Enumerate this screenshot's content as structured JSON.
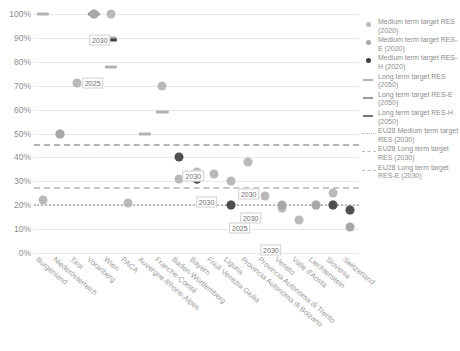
{
  "chart_data": {
    "type": "scatter",
    "title": "",
    "xlabel": "",
    "ylabel": "",
    "ylim": [
      0,
      100
    ],
    "ytick_labels": [
      "100%",
      "90%",
      "80%",
      "70%",
      "60%",
      "50%",
      "40%",
      "30%",
      "20%",
      "10%",
      "0%"
    ],
    "ytick_values": [
      100,
      90,
      80,
      70,
      60,
      50,
      40,
      30,
      20,
      10,
      0
    ],
    "grid": true,
    "legend_position": "right",
    "categories": [
      "Burgenland",
      "Niederösterreich",
      "Tirol",
      "Vorarlberg",
      "Wien",
      "PACA",
      "Auvergne-Rhone-Alpes",
      "Franche-Comté",
      "Baden-Württemberg",
      "Bayern",
      "Friuli Venezia Giulia",
      "Liguria",
      "Provincia Autonoma di Bolzano",
      "Provincia Autonoma di Trento",
      "Veneto",
      "Valle d'Aosta",
      "Liechtenstein",
      "Slovenia",
      "Switzerland"
    ],
    "series": [
      {
        "name": "Medium term target RES (2020)",
        "marker": "circle",
        "color": "#b9b9b9",
        "points": [
          {
            "category": "Vorarlberg",
            "value": 100
          },
          {
            "category": "Wien",
            "value": 100
          },
          {
            "category": "Niederösterreich",
            "value": 50
          },
          {
            "category": "Franche-Comté",
            "value": 70
          },
          {
            "category": "Bayern",
            "value": 34
          },
          {
            "category": "Friuli Venezia Giulia",
            "value": 33
          },
          {
            "category": "Liguria",
            "value": 30
          },
          {
            "category": "Provincia Autonoma di Bolzano",
            "value": 38
          },
          {
            "category": "Provincia Autonoma di Trento",
            "value": 24
          },
          {
            "category": "Veneto",
            "value": 19
          },
          {
            "category": "Valle d'Aosta",
            "value": 14
          },
          {
            "category": "Liechtenstein",
            "value": 20
          },
          {
            "category": "Slovenia",
            "value": 25
          },
          {
            "category": "Switzerland",
            "value": 18
          },
          {
            "category": "Burgenland",
            "value": 22
          },
          {
            "category": "Baden-Württemberg",
            "value": 31
          },
          {
            "category": "Tirol",
            "value": 71
          },
          {
            "category": "PACA",
            "value": 21
          }
        ]
      },
      {
        "name": "Medium term target RES-E (2020)",
        "marker": "circle",
        "color": "#a8a8a8",
        "points": [
          {
            "category": "Vorarlberg",
            "value": 100
          },
          {
            "category": "Niederösterreich",
            "value": 50
          },
          {
            "category": "Liguria",
            "value": 20
          },
          {
            "category": "Veneto",
            "value": 20
          },
          {
            "category": "Liechtenstein",
            "value": 20
          },
          {
            "category": "Slovenia",
            "value": 20
          },
          {
            "category": "Switzerland",
            "value": 11
          }
        ]
      },
      {
        "name": "Medium term target RES-H (2020)",
        "marker": "circle",
        "color": "#4f4f4f",
        "points": [
          {
            "category": "Baden-Württemberg",
            "value": 40
          },
          {
            "category": "Bayern",
            "value": 31
          },
          {
            "category": "Liguria",
            "value": 20
          },
          {
            "category": "Provincia Autonoma di Bolzano",
            "value": 15
          },
          {
            "category": "Slovinia-alt",
            "value": 31
          },
          {
            "category": "Slovenia",
            "value": 20
          },
          {
            "category": "Switzerland",
            "value": 18
          }
        ]
      },
      {
        "name": "Long term target RES (2050)",
        "marker": "dash",
        "color": "#b3b3b3",
        "points": [
          {
            "category": "Burgenland",
            "value": 100
          },
          {
            "category": "Vorarlberg",
            "value": 100
          },
          {
            "category": "Wien",
            "value": 90
          },
          {
            "category": "Wien-alt",
            "value": 78
          },
          {
            "category": "Franche-Comté",
            "value": 59
          },
          {
            "category": "Auvergne-Rhone-Alpes",
            "value": 50
          },
          {
            "category": "Bayern",
            "value": 31
          }
        ]
      },
      {
        "name": "Long term target RES-E (2050)",
        "marker": "dash",
        "color": "#9d9d9d",
        "points": [
          {
            "category": "Vorarlberg",
            "value": 100
          }
        ]
      },
      {
        "name": "Long term target RES-H (2050)",
        "marker": "dash",
        "color": "#3f3f3f",
        "points": [
          {
            "category": "Wien",
            "value": 89
          }
        ]
      },
      {
        "name": "EU28 Medium term target RES (2030)",
        "marker": "dotted-line",
        "color": "#bdbdbd",
        "value": 20
      },
      {
        "name": "EU28 Long term target RES (2030)",
        "marker": "dashed-line",
        "color": "#b5b5b5",
        "value": 45
      },
      {
        "name": "EU28 Long term target RES-E (2030)",
        "marker": "dashed-line",
        "color": "#c6c6c6",
        "value": 27
      }
    ],
    "annotations": [
      {
        "label": "2030",
        "category": "Vorarlberg",
        "value": 96
      },
      {
        "label": "2025",
        "category": "Tirol",
        "value": 71
      },
      {
        "label": "2030",
        "category": "Baden-Württemberg",
        "value": 33
      },
      {
        "label": "2030",
        "category": "Bayern",
        "value": 27
      },
      {
        "label": "2030",
        "category": "Liguria",
        "value": 23
      },
      {
        "label": "2030",
        "category": "Liguria",
        "value": 19
      },
      {
        "label": "2025",
        "category": "Provincia Autonoma di Bolzano",
        "value": 17
      },
      {
        "label": "2030",
        "category": "Provincia Autonoma di Trento",
        "value": 12
      }
    ]
  },
  "legend": {
    "entries": [
      {
        "key": "dot-res",
        "label": "Medium term target RES (2020)"
      },
      {
        "key": "dot-rese",
        "label": "Medium term target RES-E (2020)"
      },
      {
        "key": "dot-resh",
        "label": "Medium term target RES-H (2020)"
      },
      {
        "key": "dash-res",
        "label": "Long term target RES (2050)"
      },
      {
        "key": "dash-rese",
        "label": "Long term target RES-E (2050)"
      },
      {
        "key": "dash-resh",
        "label": "Long term target RES-H (2050)"
      },
      {
        "key": "dotted-eu",
        "label": "EU28 Medium term target RES (2030)"
      },
      {
        "key": "dashed-eu1",
        "label": "EU28 Long term target RES (2030)"
      },
      {
        "key": "dashed-eu2",
        "label": "EU28 Long term target RES-E (2030)"
      }
    ]
  }
}
